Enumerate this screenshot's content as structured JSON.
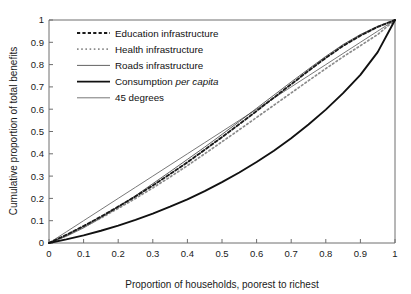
{
  "chart_data": {
    "type": "line",
    "title": "",
    "xlabel": "Proportion of households, poorest to richest",
    "ylabel": "Cumulative proportion of total benefits",
    "xlim": [
      0,
      1
    ],
    "ylim": [
      0,
      1
    ],
    "grid": false,
    "legend_position": "top-left inside plot",
    "xticks": [
      "0",
      "0.1",
      "0.2",
      "0.3",
      "0.4",
      "0.5",
      "0.6",
      "0.7",
      "0.8",
      "0.9",
      "1"
    ],
    "yticks": [
      "0",
      "0.1",
      "0.2",
      "0.3",
      "0.4",
      "0.5",
      "0.6",
      "0.7",
      "0.8",
      "0.9",
      "1"
    ],
    "xtick_values": [
      0,
      0.1,
      0.2,
      0.3,
      0.4,
      0.5,
      0.6,
      0.7,
      0.8,
      0.9,
      1
    ],
    "ytick_values": [
      0,
      0.1,
      0.2,
      0.3,
      0.4,
      0.5,
      0.6,
      0.7,
      0.8,
      0.9,
      1
    ],
    "x": [
      0,
      0.05,
      0.1,
      0.15,
      0.2,
      0.25,
      0.3,
      0.35,
      0.4,
      0.45,
      0.5,
      0.55,
      0.6,
      0.65,
      0.7,
      0.75,
      0.8,
      0.85,
      0.9,
      0.95,
      1
    ],
    "series": [
      {
        "name": "Education infrastructure",
        "style": "dashed-bold",
        "color": "#1a1a1a",
        "width": 1.9,
        "dash": "3.2,2.2",
        "values": [
          0,
          0.036,
          0.076,
          0.118,
          0.163,
          0.209,
          0.258,
          0.309,
          0.362,
          0.418,
          0.475,
          0.533,
          0.592,
          0.652,
          0.712,
          0.772,
          0.83,
          0.884,
          0.93,
          0.969,
          1
        ]
      },
      {
        "name": "Health infrastructure",
        "style": "dotted-light",
        "color": "#8c8c8c",
        "width": 1.7,
        "dash": "1.6,2.6",
        "values": [
          0,
          0.034,
          0.072,
          0.112,
          0.155,
          0.2,
          0.247,
          0.296,
          0.347,
          0.4,
          0.454,
          0.508,
          0.563,
          0.618,
          0.673,
          0.728,
          0.782,
          0.835,
          0.885,
          0.935,
          1
        ]
      },
      {
        "name": "Roads infrastructure",
        "style": "solid-thin",
        "color": "#3a3a3a",
        "width": 0.8,
        "dash": "none",
        "values": [
          0,
          0.03,
          0.068,
          0.112,
          0.162,
          0.212,
          0.266,
          0.32,
          0.375,
          0.43,
          0.487,
          0.545,
          0.604,
          0.663,
          0.722,
          0.78,
          0.837,
          0.89,
          0.935,
          0.972,
          1
        ]
      },
      {
        "name": "Consumption per capita",
        "style": "solid-bold",
        "color": "#111111",
        "width": 1.9,
        "dash": "none",
        "values": [
          0,
          0.016,
          0.034,
          0.055,
          0.078,
          0.104,
          0.132,
          0.163,
          0.196,
          0.233,
          0.273,
          0.316,
          0.363,
          0.414,
          0.47,
          0.531,
          0.598,
          0.672,
          0.754,
          0.856,
          1
        ]
      },
      {
        "name": "45 degrees",
        "style": "solid-thin",
        "color": "#555555",
        "width": 0.8,
        "dash": "none",
        "values": [
          0,
          0.05,
          0.1,
          0.15,
          0.2,
          0.25,
          0.3,
          0.35,
          0.4,
          0.45,
          0.5,
          0.55,
          0.6,
          0.65,
          0.7,
          0.75,
          0.8,
          0.85,
          0.9,
          0.95,
          1
        ]
      }
    ],
    "legend": [
      {
        "label": "Education infrastructure",
        "label_pre": "Education infrastructure",
        "label_ital": "",
        "label_post": ""
      },
      {
        "label": "Health infrastructure",
        "label_pre": "Health infrastructure",
        "label_ital": "",
        "label_post": ""
      },
      {
        "label": "Roads infrastructure",
        "label_pre": "Roads infrastructure",
        "label_ital": "",
        "label_post": ""
      },
      {
        "label": "Consumption per capita",
        "label_pre": "Consumption ",
        "label_ital": "per capita",
        "label_post": ""
      },
      {
        "label": "45 degrees",
        "label_pre": "45 degrees",
        "label_ital": "",
        "label_post": ""
      }
    ]
  },
  "colors": {
    "axis": "#6e6e6e",
    "text": "#1a1a1a",
    "background": "#ffffff"
  }
}
